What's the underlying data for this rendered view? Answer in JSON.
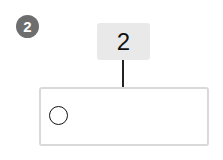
{
  "question": {
    "number_badge": "2",
    "label_box": "2"
  },
  "answer_box": {
    "option_icon": "empty-circle"
  },
  "colors": {
    "badge_bg": "#6e6e6e",
    "label_bg": "#e9e9e9",
    "border": "#d9d9d9"
  }
}
